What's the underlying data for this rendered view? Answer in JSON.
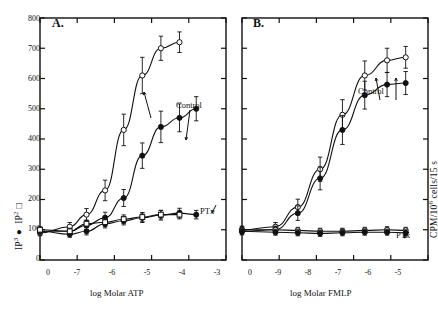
{
  "figure": {
    "background": "#ffffff",
    "ink": "#111111"
  },
  "panels": [
    {
      "letter": "A.",
      "xlabel": "log Molar ATP",
      "ylabel_main": "IP",
      "ylabel_sub": "2",
      "ylabel_tail": " □",
      "ylabel_full": "IP₃ ●  IP₂ □",
      "yticks": [
        "0",
        "100",
        "200",
        "300",
        "400",
        "500",
        "600",
        "700",
        "800"
      ],
      "xticks": [
        "0",
        "-7",
        "-6",
        "-5",
        "-4",
        "-3"
      ],
      "annotations": [
        {
          "text": "Control",
          "x": 176,
          "y": 106
        },
        {
          "text": "PTx",
          "x": 198,
          "y": 211
        }
      ],
      "chart_data": {
        "type": "line",
        "title": "A.",
        "xlabel": "log Molar ATP",
        "ylabel": "CPM/10⁶ cells/15 s",
        "xlim": [
          0.0,
          5.0
        ],
        "ylim": [
          0,
          800
        ],
        "xtick_labels": [
          "0",
          "-7",
          "-6",
          "-5",
          "-4",
          "-3"
        ],
        "ytick_labels": [
          "0",
          "100",
          "200",
          "300",
          "400",
          "500",
          "600",
          "700",
          "800"
        ],
        "grid": false,
        "legend": "inline-annotations",
        "series": [
          {
            "name": "Control IP3 (filled circle)",
            "marker": "filled-circle",
            "x": [
              0.0,
              0.8,
              1.25,
              1.75,
              2.25,
              2.75,
              3.25,
              3.75,
              4.2
            ],
            "y": [
              95,
              95,
              115,
              140,
              205,
              345,
              440,
              470,
              500
            ],
            "error": [
              12,
              10,
              14,
              18,
              28,
              42,
              52,
              46,
              40
            ]
          },
          {
            "name": "Control IP2 (open circle)",
            "marker": "open-circle",
            "x": [
              0.0,
              0.8,
              1.25,
              1.75,
              2.25,
              2.75,
              3.25,
              3.75
            ],
            "y": [
              90,
              110,
              150,
              230,
              430,
              610,
              700,
              720
            ],
            "error": [
              10,
              14,
              20,
              34,
              52,
              60,
              40,
              34
            ]
          },
          {
            "name": "PTx IP3 (filled circle)",
            "marker": "filled-circle",
            "x": [
              0.0,
              0.8,
              1.25,
              1.75,
              2.25,
              2.75,
              3.25,
              3.75,
              4.2
            ],
            "y": [
              95,
              85,
              95,
              120,
              130,
              140,
              148,
              155,
              150
            ],
            "error": [
              12,
              10,
              12,
              14,
              14,
              16,
              16,
              16,
              14
            ]
          },
          {
            "name": "PTx IP2 (open square)",
            "marker": "open-square",
            "x": [
              0.0,
              0.8,
              1.25,
              1.75,
              2.25,
              2.75,
              3.25,
              3.75
            ],
            "y": [
              100,
              95,
              120,
              125,
              135,
              142,
              150,
              150
            ],
            "error": [
              10,
              10,
              12,
              14,
              14,
              14,
              14,
              14
            ]
          }
        ]
      }
    },
    {
      "letter": "B.",
      "xlabel": "log Molar FMLP",
      "yticks": [],
      "xticks": [
        "0",
        "-9",
        "-8",
        "-7",
        "-6",
        "-5"
      ],
      "annotations": [
        {
          "text": "Control",
          "x": 388,
          "y": 92
        },
        {
          "text": "PTx",
          "x": 398,
          "y": 235
        }
      ],
      "chart_data": {
        "type": "line",
        "title": "B.",
        "xlabel": "log Molar FMLP",
        "ylabel": "",
        "xlim": [
          0.0,
          5.0
        ],
        "ylim": [
          0,
          800
        ],
        "xtick_labels": [
          "0",
          "-9",
          "-8",
          "-7",
          "-6",
          "-5"
        ],
        "grid": false,
        "series": [
          {
            "name": "Control IP2 (open circle)",
            "marker": "open-circle",
            "x": [
              0.0,
              0.9,
              1.5,
              2.1,
              2.7,
              3.3,
              3.9,
              4.4
            ],
            "y": [
              100,
              110,
              175,
              300,
              480,
              610,
              660,
              670
            ],
            "error": [
              12,
              14,
              26,
              40,
              50,
              48,
              40,
              36
            ]
          },
          {
            "name": "Control IP3 (filled circle)",
            "marker": "filled-circle",
            "x": [
              0.0,
              0.9,
              1.5,
              2.1,
              2.7,
              3.3,
              3.9,
              4.4
            ],
            "y": [
              95,
              100,
              155,
              270,
              430,
              545,
              580,
              585
            ],
            "error": [
              12,
              12,
              24,
              38,
              48,
              46,
              40,
              38
            ]
          },
          {
            "name": "PTx IP2 (open circle/triangle)",
            "marker": "open-circle",
            "x": [
              0.0,
              0.9,
              1.5,
              2.1,
              2.7,
              3.3,
              3.9,
              4.4
            ],
            "y": [
              100,
              100,
              98,
              95,
              95,
              98,
              100,
              98
            ],
            "error": [
              10,
              10,
              10,
              10,
              10,
              10,
              10,
              10
            ]
          },
          {
            "name": "PTx IP3 (filled circle)",
            "marker": "filled-circle",
            "x": [
              0.0,
              0.9,
              1.5,
              2.1,
              2.7,
              3.3,
              3.9,
              4.4
            ],
            "y": [
              95,
              92,
              90,
              88,
              90,
              92,
              92,
              90
            ],
            "error": [
              10,
              10,
              10,
              10,
              10,
              10,
              10,
              10
            ]
          }
        ]
      }
    }
  ],
  "axis_labels": {
    "y_axis_right": "CPM/10⁶ cells/15 s"
  }
}
